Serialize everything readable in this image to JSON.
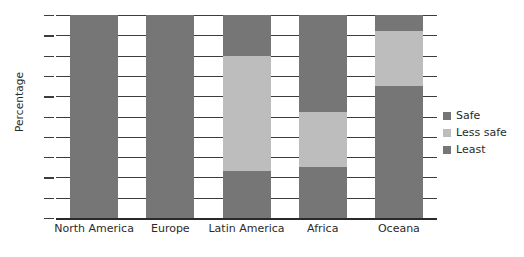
{
  "chart_data": {
    "type": "bar",
    "title": "",
    "subtitle": "",
    "xlabel": "",
    "ylabel": "Percentage",
    "ylim": [
      0,
      100
    ],
    "ytick_labels": [
      "100",
      "90",
      "80",
      "70",
      "60",
      "50",
      "40",
      "30",
      "20",
      "10",
      "0"
    ],
    "ytick_values": [
      100,
      90,
      80,
      70,
      60,
      50,
      40,
      30,
      20,
      10,
      0
    ],
    "grid": true,
    "stacked": true,
    "legend_position": "right",
    "categories": [
      "North America",
      "Europe",
      "Latin America",
      "Africa",
      "Oceana"
    ],
    "series": [
      {
        "name": "Safe",
        "color": "#767676",
        "values": [
          2,
          20,
          20,
          48,
          8
        ]
      },
      {
        "name": "Less safe",
        "color": "#bdbdbd",
        "values": [
          0,
          0,
          57,
          27,
          27
        ]
      },
      {
        "name": "Least",
        "color": "#767676",
        "values": [
          98,
          80,
          23,
          25,
          65
        ]
      }
    ],
    "segment_boundaries": {
      "North America": [
        98,
        100
      ],
      "Europe": [
        80,
        80
      ],
      "Latin America": [
        23,
        80
      ],
      "Africa": [
        25,
        52
      ],
      "Oceana": [
        65,
        92
      ]
    }
  },
  "legend": {
    "items": [
      {
        "label": "Safe",
        "swatch_name": "legend-swatch-safe"
      },
      {
        "label": "Less safe",
        "swatch_name": "legend-swatch-less-safe"
      },
      {
        "label": "Least",
        "swatch_name": "legend-swatch-least"
      }
    ]
  }
}
